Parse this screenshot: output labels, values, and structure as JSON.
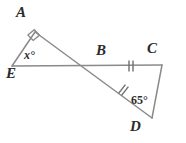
{
  "figure": {
    "kind": "geometry-diagram",
    "stroke_color": "#8a8a8a",
    "label_color": "#2b2b2b",
    "background_color": "#ffffff",
    "width": 186,
    "height": 143,
    "vertices": [
      {
        "id": "A",
        "label": "A",
        "x": 35,
        "y": 32,
        "label_x": 16,
        "label_y": 5
      },
      {
        "id": "B",
        "label": "B",
        "x": 100,
        "y": 66,
        "label_x": 96,
        "label_y": 43
      },
      {
        "id": "C",
        "label": "C",
        "x": 162,
        "y": 65,
        "label_x": 147,
        "label_y": 41
      },
      {
        "id": "D",
        "label": "D",
        "x": 152,
        "y": 118,
        "label_x": 130,
        "label_y": 119
      },
      {
        "id": "E",
        "label": "E",
        "x": 12,
        "y": 66,
        "label_x": 6,
        "label_y": 66
      }
    ],
    "segments": [
      {
        "id": "EA",
        "from": "E",
        "to": "A",
        "ticks": 0
      },
      {
        "id": "ABD",
        "from": "A",
        "to": "D",
        "ticks": 0
      },
      {
        "id": "EBC",
        "from": "E",
        "to": "C",
        "ticks": 0
      },
      {
        "id": "BC",
        "from": "B",
        "to": "C",
        "ticks": 2
      },
      {
        "id": "BD",
        "from": "B",
        "to": "D",
        "ticks": 2
      },
      {
        "id": "CD",
        "from": "C",
        "to": "D",
        "ticks": 0
      }
    ],
    "congruence_marks": [
      {
        "on_segment": "BC",
        "count": 2,
        "note": "double tick"
      },
      {
        "on_segment": "BD",
        "count": 2,
        "note": "double tick"
      }
    ],
    "angles": [
      {
        "id": "angle-A",
        "at": "A",
        "mark": "right-angle-square",
        "value": "",
        "value_x": 0,
        "value_y": 0
      },
      {
        "id": "angle-E",
        "at": "E",
        "mark": "label",
        "value": "x°",
        "value_x": 24,
        "value_y": 49
      },
      {
        "id": "angle-D",
        "at": "D",
        "mark": "label",
        "value": "65°",
        "value_x": 131,
        "value_y": 94
      }
    ],
    "unknown_variable": "x"
  }
}
